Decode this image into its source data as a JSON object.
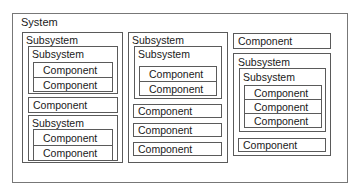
{
  "system": {
    "label": "System",
    "columns": [
      {
        "subsystem_label": "Subsystem",
        "inner_subsystem": {
          "label": "Subsystem",
          "components": [
            "Component",
            "Component"
          ]
        },
        "component": "Component",
        "lower_subsystem": {
          "label": "Subsystem",
          "components": [
            "Component",
            "Component"
          ]
        }
      },
      {
        "subsystem_label": "Subsystem",
        "inner_subsystem": {
          "label": "Subsystem",
          "components": [
            "Component",
            "Component"
          ]
        },
        "components": [
          "Component",
          "Component",
          "Component"
        ]
      },
      {
        "top_component": "Component",
        "subsystem": {
          "label": "Subsystem",
          "inner_subsystem": {
            "label": "Subsystem",
            "components": [
              "Component",
              "Component",
              "Component"
            ]
          }
        },
        "bottom_component": "Component"
      }
    ]
  }
}
